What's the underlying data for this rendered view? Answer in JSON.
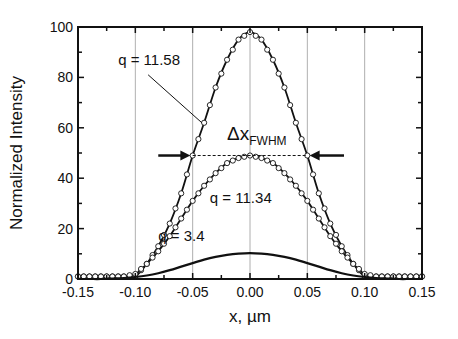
{
  "chart_data": {
    "type": "line",
    "title": "",
    "xlabel": "x, µm",
    "ylabel": "Normalized Intensity",
    "xlim": [
      -0.15,
      0.15
    ],
    "ylim": [
      0,
      100
    ],
    "x_ticks": [
      -0.15,
      -0.1,
      -0.05,
      0.0,
      0.05,
      0.1,
      0.15
    ],
    "x_tick_labels": [
      "-0.15",
      "-0.10",
      "-0.05",
      "0.00",
      "0.05",
      "0.10",
      "0.15"
    ],
    "y_ticks": [
      0,
      20,
      40,
      60,
      80,
      100
    ],
    "y_tick_labels": [
      "0",
      "20",
      "40",
      "60",
      "80",
      "100"
    ],
    "grid": {
      "vertical": [
        -0.1,
        -0.05,
        0.0,
        0.05,
        0.1
      ],
      "horizontal": false
    },
    "legend": null,
    "x": [
      -0.15,
      -0.14,
      -0.13,
      -0.12,
      -0.11,
      -0.1,
      -0.09,
      -0.08,
      -0.07,
      -0.06,
      -0.05,
      -0.04,
      -0.03,
      -0.02,
      -0.01,
      0.0,
      0.01,
      0.02,
      0.03,
      0.04,
      0.05,
      0.06,
      0.07,
      0.08,
      0.09,
      0.1,
      0.11,
      0.12,
      0.13,
      0.14,
      0.15
    ],
    "series": [
      {
        "name": "q = 11.58",
        "style": "line+open-circles",
        "values": [
          1,
          1,
          1,
          1,
          1,
          1,
          6,
          13,
          22,
          34,
          49,
          62,
          76,
          87,
          95,
          98,
          95,
          87,
          76,
          62,
          49,
          34,
          22,
          13,
          6,
          1,
          1,
          1,
          1,
          1,
          1
        ]
      },
      {
        "name": "q = 11.34",
        "style": "line+open-circles",
        "values": [
          1,
          1,
          1,
          1,
          1,
          2,
          6,
          11,
          17,
          24,
          31,
          37,
          42,
          46,
          48,
          49,
          48,
          46,
          42,
          37,
          31,
          24,
          17,
          11,
          6,
          2,
          1,
          1,
          1,
          1,
          1
        ]
      },
      {
        "name": "q = 3.4",
        "style": "line",
        "values": [
          0,
          0,
          0,
          0.2,
          0.4,
          0.8,
          1.4,
          2.3,
          3.5,
          4.9,
          6.3,
          7.7,
          8.8,
          9.6,
          10.1,
          10.3,
          10.1,
          9.6,
          8.8,
          7.7,
          6.3,
          4.9,
          3.5,
          2.3,
          1.4,
          0.8,
          0.4,
          0.2,
          0,
          0,
          0
        ]
      }
    ],
    "annotations": [
      {
        "text": "q = 11.58",
        "x": -0.115,
        "y": 85,
        "arrow_to": [
          -0.042,
          62
        ]
      },
      {
        "text": "q = 11.34",
        "x": -0.035,
        "y": 30
      },
      {
        "text": "q = 3.4",
        "x": -0.08,
        "y": 15
      },
      {
        "text": "Δx",
        "subscript": "FWHM",
        "x": -0.02,
        "y": 55
      },
      {
        "text": "FWHM dashed line",
        "x_from": -0.05,
        "x_to": 0.05,
        "y": 49
      },
      {
        "text": "left arrow",
        "x_from": -0.08,
        "x_to": -0.052,
        "y": 49
      },
      {
        "text": "right arrow",
        "x_from": 0.082,
        "x_to": 0.052,
        "y": 49
      }
    ]
  }
}
